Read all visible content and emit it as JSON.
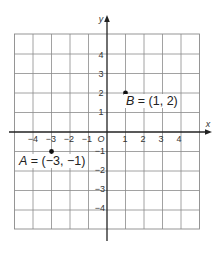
{
  "chart_data": {
    "type": "scatter",
    "title": "",
    "xlabel": "x",
    "ylabel": "y",
    "xlim": [
      -5,
      5
    ],
    "ylim": [
      -5,
      5
    ],
    "grid": true,
    "x_ticks": [
      -4,
      -3,
      -2,
      -1,
      1,
      2,
      3,
      4
    ],
    "y_ticks": [
      4,
      3,
      2,
      1,
      -1,
      -2,
      -3,
      -4
    ],
    "origin_label": "O",
    "points": [
      {
        "name": "A",
        "x": -3,
        "y": -1,
        "label": "A = (−3, −1)"
      },
      {
        "name": "B",
        "x": 1,
        "y": 2,
        "label": "B = (1, 2)"
      }
    ]
  },
  "labels": {
    "x_axis": "x",
    "y_axis": "y",
    "origin": "O",
    "point_a_name": "A",
    "point_a_coords": " = (−3, −1)",
    "point_b_name": "B",
    "point_b_coords": " = (1, 2)"
  },
  "tick_labels": {
    "x": [
      "−4",
      "−3",
      "−2",
      "−1",
      "1",
      "2",
      "3",
      "4"
    ],
    "y": [
      "4",
      "3",
      "2",
      "1",
      "−1",
      "−2",
      "−3",
      "−4"
    ]
  }
}
